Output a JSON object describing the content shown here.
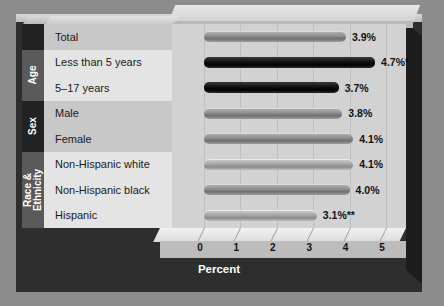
{
  "chart_data": {
    "type": "bar",
    "orientation": "horizontal",
    "title": "",
    "xlabel": "Percent",
    "ylabel": "",
    "xlim": [
      0,
      5
    ],
    "xticks": [
      "0",
      "1",
      "2",
      "3",
      "4",
      "5"
    ],
    "grid": true,
    "legend": "none",
    "groups": [
      {
        "name": "",
        "rows": [
          0
        ]
      },
      {
        "name": "Age",
        "rows": [
          1,
          2
        ]
      },
      {
        "name": "Sex",
        "rows": [
          3,
          4
        ]
      },
      {
        "name": "Race &\nEthnicity",
        "rows": [
          5,
          6,
          7
        ]
      }
    ],
    "categories": [
      "Total",
      "Less than 5 years",
      "5–17 years",
      "Male",
      "Female",
      "Non-Hispanic white",
      "Non-Hispanic black",
      "Hispanic"
    ],
    "values": [
      3.9,
      4.7,
      3.7,
      3.8,
      4.1,
      4.1,
      4.0,
      3.1
    ],
    "value_labels": [
      "3.9%",
      "4.7%*",
      "3.7%",
      "3.8%",
      "4.1%",
      "4.1%",
      "4.0%",
      "3.1%**"
    ],
    "bar_styles": [
      "light",
      "dark",
      "dark",
      "light",
      "light",
      "pale",
      "light",
      "pale"
    ]
  },
  "group_labels": {
    "age": "Age",
    "sex": "Sex",
    "race_line1": "Race &",
    "race_line2": "Ethnicity"
  },
  "axis": {
    "title": "Percent"
  },
  "colors": {
    "background": "#8c8c8c",
    "frame_dark": "#2e2e2e",
    "plot_panel": "#d2d2d2",
    "label_band_a": "#c8c8c8",
    "label_band_b": "#e4e4e4",
    "group_dark": "#222222",
    "group_mid": "#5a5a5a",
    "axis_strip": "#bcbcbc",
    "text_dark": "#111111",
    "text_light": "#ffffff"
  }
}
